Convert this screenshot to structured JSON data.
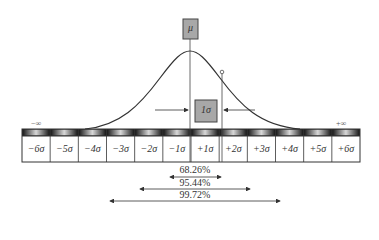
{
  "diagram": {
    "mean_label": "μ",
    "sigma_box_label": "1σ",
    "neg_infinity": "−∞",
    "pos_infinity": "+∞",
    "sigma_cells": [
      "−6σ",
      "−5σ",
      "−4σ",
      "−3σ",
      "−2σ",
      "−1σ",
      "+1σ",
      "+2σ",
      "+3σ",
      "+4σ",
      "+5σ",
      "+6σ"
    ],
    "coverage": [
      {
        "label": "68.26%",
        "range": "±1σ"
      },
      {
        "label": "95.44%",
        "range": "±2σ"
      },
      {
        "label": "99.72%",
        "range": "±3σ"
      }
    ],
    "colors": {
      "box_fill": "#a8a8a8",
      "line": "#333333",
      "band_dark": "#2a2a2a"
    }
  }
}
